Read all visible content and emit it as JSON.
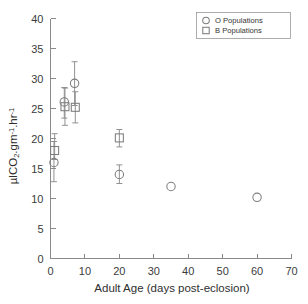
{
  "chart_data": {
    "type": "scatter",
    "title": "",
    "xlabel": "Adult Age (days post-eclosion)",
    "ylabel": "µlCO2.gm-1.hr-1",
    "ylabel_parts": {
      "prefix": "µlCO",
      "sub1": "2",
      "mid": ".gm",
      "sup1": "-1",
      "mid2": ".hr",
      "sup2": "-1"
    },
    "xlim": [
      0,
      70
    ],
    "ylim": [
      0,
      40
    ],
    "xticks": [
      0,
      10,
      20,
      30,
      40,
      50,
      60,
      70
    ],
    "yticks": [
      0,
      5,
      10,
      15,
      20,
      25,
      30,
      35,
      40
    ],
    "xtick_labels": [
      "0",
      "10",
      "20",
      "30",
      "40",
      "50",
      "60",
      "70"
    ],
    "ytick_labels": [
      "0",
      "5",
      "10",
      "15",
      "20",
      "25",
      "30",
      "35",
      "40"
    ],
    "grid": false,
    "legend_position": "top-right",
    "error_bar_type": "symmetric",
    "series": [
      {
        "name": "O Populations",
        "marker": "circle",
        "color": "#7d7d7d",
        "points": [
          {
            "x": 1,
            "y": 16.0,
            "yerr_low": 12.8,
            "yerr_high": 19.5
          },
          {
            "x": 4,
            "y": 26.1,
            "yerr_low": 23.4,
            "yerr_high": 28.5
          },
          {
            "x": 7,
            "y": 29.2,
            "yerr_low": 25.5,
            "yerr_high": 32.8
          },
          {
            "x": 20,
            "y": 14.0,
            "yerr_low": 12.5,
            "yerr_high": 15.6
          },
          {
            "x": 35,
            "y": 12.0,
            "yerr_low": 12.0,
            "yerr_high": 12.0
          },
          {
            "x": 60,
            "y": 10.2,
            "yerr_low": 10.2,
            "yerr_high": 10.2
          }
        ]
      },
      {
        "name": "B Populations",
        "marker": "square",
        "color": "#7d7d7d",
        "points": [
          {
            "x": 1.2,
            "y": 18.0,
            "yerr_low": 16.5,
            "yerr_high": 20.8
          },
          {
            "x": 4.2,
            "y": 25.3,
            "yerr_low": 22.2,
            "yerr_high": 28.4
          },
          {
            "x": 7.2,
            "y": 25.2,
            "yerr_low": 22.6,
            "yerr_high": 27.8
          },
          {
            "x": 20,
            "y": 20.1,
            "yerr_low": 18.6,
            "yerr_high": 21.5
          }
        ]
      }
    ],
    "legend": [
      {
        "label": "O Populations",
        "marker": "circle"
      },
      {
        "label": "B Populations",
        "marker": "square"
      }
    ]
  }
}
